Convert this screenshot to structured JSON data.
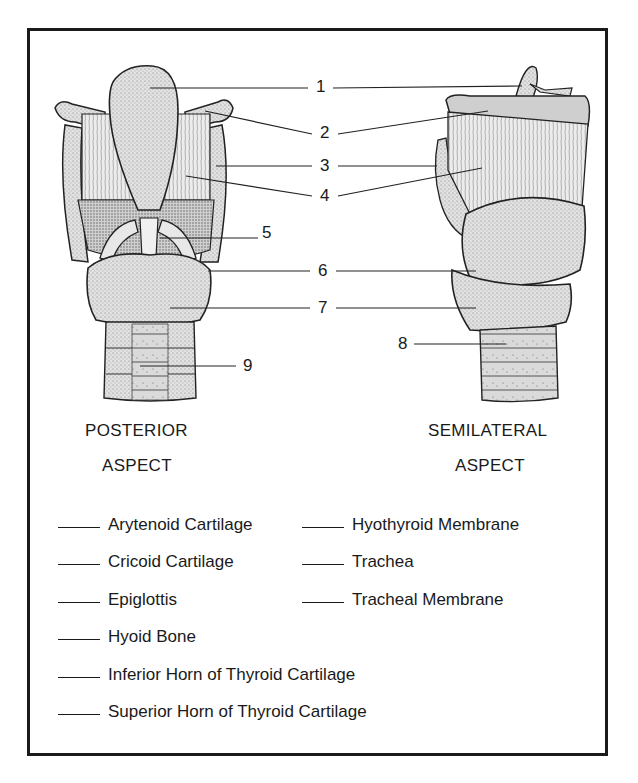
{
  "diagram": {
    "views": [
      {
        "id": "posterior",
        "caption_line1": "POSTERIOR",
        "caption_line2": "ASPECT"
      },
      {
        "id": "semilateral",
        "caption_line1": "SEMILATERAL",
        "caption_line2": "ASPECT"
      }
    ],
    "callout_numbers": [
      "1",
      "2",
      "3",
      "4",
      "5",
      "6",
      "7",
      "8",
      "9"
    ],
    "terms": [
      {
        "blank": "____",
        "label": "Arytenoid Cartilage"
      },
      {
        "blank": "____",
        "label": "Cricoid Cartilage"
      },
      {
        "blank": "____",
        "label": "Epiglottis"
      },
      {
        "blank": "____",
        "label": "Hyoid Bone"
      },
      {
        "blank": "____",
        "label": "Inferior Horn of Thyroid Cartilage"
      },
      {
        "blank": "____",
        "label": "Superior Horn of Thyroid Cartilage"
      },
      {
        "blank": "____",
        "label": "Hyothyroid Membrane"
      },
      {
        "blank": "____",
        "label": "Trachea"
      },
      {
        "blank": "____",
        "label": "Tracheal Membrane"
      }
    ],
    "colors": {
      "ink": "#1a1a1a",
      "fill_light": "#dcdcdc",
      "fill_mid": "#c4c4c4",
      "membrane": "#e6e6e6"
    }
  }
}
